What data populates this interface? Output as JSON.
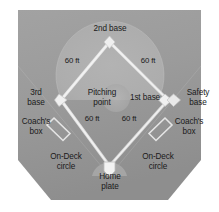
{
  "diagram": {
    "type": "baseball-diamond",
    "colors": {
      "page_background": "#ffffff",
      "outfield_grass": "#9a9a9a",
      "infield_dirt": "#adadad",
      "baseline_chalk": "#e8e8e8",
      "base_fill": "#f0f0f0",
      "text": "#1a1a1a",
      "home_dirt": "#a5a5a5"
    },
    "labels": {
      "second_base": "2nd base",
      "third_base": "3rd\nbase",
      "first_base": "1st base",
      "safety_base": "Safety\nbase",
      "pitching_point": "Pitching\npoint",
      "home_plate": "Home\nplate",
      "coach_box_left": "Coach's\nbox",
      "coach_box_right": "Coach's\nbox",
      "on_deck_left": "On-Deck\ncircle",
      "on_deck_right": "On-Deck\ncircle",
      "dist_third_to_second": "60 ft",
      "dist_second_to_first": "60 ft",
      "dist_home_to_third": "60 ft",
      "dist_home_to_first": "60 ft"
    },
    "measurements": {
      "baseline_length": "60 ft",
      "baseline_count": 4
    }
  }
}
